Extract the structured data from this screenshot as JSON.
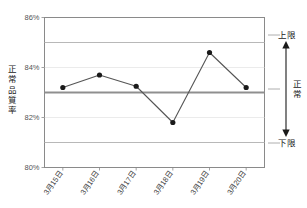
{
  "chart_data": {
    "type": "line",
    "title": "",
    "xlabel": "",
    "ylabel": "正常品質率",
    "categories": [
      "3月15日",
      "3月16日",
      "3月17日",
      "3月18日",
      "3月19日",
      "3月20日"
    ],
    "values": [
      83.2,
      83.7,
      83.25,
      81.8,
      84.6,
      83.2
    ],
    "series": [
      {
        "name": "正常品質率",
        "values": [
          83.2,
          83.7,
          83.25,
          81.8,
          84.6,
          83.2
        ]
      }
    ],
    "ylim": [
      80,
      86
    ],
    "yticks": [
      80,
      82,
      84,
      86
    ],
    "ytick_labels": [
      "80%",
      "82%",
      "84%",
      "86%"
    ],
    "grid": true,
    "legend": "none",
    "reference_lines": [
      {
        "name": "upper_limit",
        "value": 85,
        "label": "上限",
        "color": "#b8b8b8",
        "width": 1.2
      },
      {
        "name": "center_line",
        "value": 83,
        "label": "正常",
        "color": "#8f8f8f",
        "width": 2.2
      },
      {
        "name": "lower_limit",
        "value": 81,
        "label": "下限",
        "color": "#b8b8b8",
        "width": 1.2
      }
    ],
    "annotations": {
      "upper_label": "上限",
      "normal_label": "正常",
      "lower_label": "下限",
      "arrow": "double-headed-vertical"
    },
    "colors": {
      "line": "#555555",
      "marker": "#1a1a1a",
      "axis": "#8a8a8a",
      "grid": "#c9c9c9",
      "background": "#ffffff"
    }
  },
  "axis": {
    "y_title": "正常品質率",
    "y_title_chars": [
      "正",
      "常",
      "品",
      "質",
      "率"
    ]
  },
  "side_panel": {
    "upper": "上限",
    "normal": "正常",
    "normal_chars": [
      "正",
      "常"
    ],
    "lower": "下限"
  }
}
